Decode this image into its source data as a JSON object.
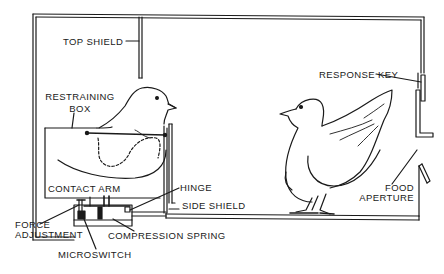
{
  "diagram": {
    "type": "apparatus-schematic",
    "colors": {
      "ink": "#1a1a1a",
      "background": "#ffffff"
    },
    "labels": {
      "top_shield": "TOP SHIELD",
      "restraining_box_line1": "RESTRAINING",
      "restraining_box_line2": "BOX",
      "response_key": "RESPONSE KEY",
      "contact_arm": "CONTACT ARM",
      "hinge": "HINGE",
      "side_shield": "SIDE SHIELD",
      "food_aperture_line1": "FOOD",
      "food_aperture_line2": "APERTURE",
      "force_adjustment_line1": "FORCE",
      "force_adjustment_line2": "ADJUSTMENT",
      "compression_spring": "COMPRESSION SPRING",
      "microswitch": "MICROSWITCH"
    },
    "figures": [
      {
        "name": "restrained-pigeon",
        "location": "inside restraining box, left"
      },
      {
        "name": "free-pigeon",
        "location": "chamber floor, right"
      }
    ]
  }
}
